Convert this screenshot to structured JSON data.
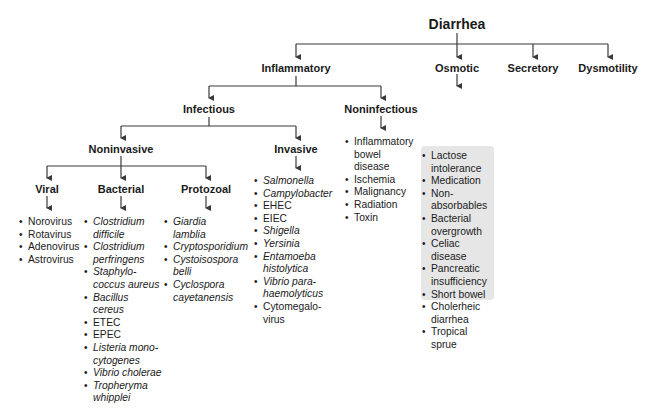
{
  "title": "Diarrhea",
  "categories": {
    "inflammatory": "Inflammatory",
    "osmotic": "Osmotic",
    "secretory": "Secretory",
    "dysmotility": "Dysmotility",
    "infectious": "Infectious",
    "noninfectious": "Noninfectious",
    "noninvasive": "Noninvasive",
    "invasive": "Invasive",
    "viral": "Viral",
    "bacterial": "Bacterial",
    "protozoal": "Protozoal"
  },
  "lists": {
    "viral": [
      "Norovirus",
      "Rotavirus",
      "Adenovirus",
      "Astrovirus"
    ],
    "bacterial": [
      {
        "lines": [
          "Clostridium",
          "difficile"
        ],
        "italic": true
      },
      {
        "lines": [
          "Clostridium",
          "perfringens"
        ],
        "italic": true
      },
      {
        "lines": [
          "Staphylo-",
          "coccus aureus"
        ],
        "italic": true
      },
      {
        "lines": [
          "Bacillus",
          "cereus"
        ],
        "italic": true
      },
      {
        "lines": [
          "ETEC"
        ],
        "italic": false
      },
      {
        "lines": [
          "EPEC"
        ],
        "italic": false
      },
      {
        "lines": [
          "Listeria mono-",
          "cytogenes"
        ],
        "italic": true
      },
      {
        "lines": [
          "Vibrio cholerae"
        ],
        "italic": true
      },
      {
        "lines": [
          "Tropheryma",
          "whipplei"
        ],
        "italic": true
      }
    ],
    "protozoal": [
      {
        "lines": [
          "Giardia",
          "lamblia"
        ],
        "italic": true
      },
      {
        "lines": [
          "Cryptosporidium"
        ],
        "italic": true
      },
      {
        "lines": [
          "Cystoisospora",
          "belli"
        ],
        "italic": true
      },
      {
        "lines": [
          "Cyclospora",
          "cayetanensis"
        ],
        "italic": true
      }
    ],
    "invasive": [
      {
        "lines": [
          "Salmonella"
        ],
        "italic": true
      },
      {
        "lines": [
          "Campylobacter"
        ],
        "italic": true
      },
      {
        "lines": [
          "EHEC"
        ],
        "italic": false
      },
      {
        "lines": [
          "EIEC"
        ],
        "italic": false
      },
      {
        "lines": [
          "Shigella"
        ],
        "italic": true
      },
      {
        "lines": [
          "Yersinia"
        ],
        "italic": true
      },
      {
        "lines": [
          "Entamoeba",
          "histolytica"
        ],
        "italic": true
      },
      {
        "lines": [
          "Vibrio para-",
          "haemolyticus"
        ],
        "italic": true
      },
      {
        "lines": [
          "Cytomegalo-",
          "virus"
        ],
        "italic": false
      }
    ],
    "noninfectious": [
      {
        "lines": [
          "Inflammatory",
          "bowel",
          "disease"
        ],
        "italic": false
      },
      {
        "lines": [
          "Ischemia"
        ],
        "italic": false
      },
      {
        "lines": [
          "Malignancy"
        ],
        "italic": false
      },
      {
        "lines": [
          "Radiation"
        ],
        "italic": false
      },
      {
        "lines": [
          "Toxin"
        ],
        "italic": false
      }
    ],
    "osmotic": [
      {
        "lines": [
          "Lactose",
          "intolerance"
        ],
        "italic": false
      },
      {
        "lines": [
          "Medication"
        ],
        "italic": false
      },
      {
        "lines": [
          "Non-",
          "absorbables"
        ],
        "italic": false
      },
      {
        "lines": [
          "Bacterial",
          "overgrowth"
        ],
        "italic": false
      },
      {
        "lines": [
          "Celiac",
          "disease"
        ],
        "italic": false
      },
      {
        "lines": [
          "Pancreatic",
          "insufficiency"
        ],
        "italic": false
      },
      {
        "lines": [
          "Short bowel"
        ],
        "italic": false
      },
      {
        "lines": [
          "Cholerheic",
          "diarrhea"
        ],
        "italic": false
      },
      {
        "lines": [
          "Tropical",
          "sprue"
        ],
        "italic": false
      }
    ]
  },
  "colors": {
    "line": "#3a3a3a",
    "shade": "#e6e6e6"
  }
}
